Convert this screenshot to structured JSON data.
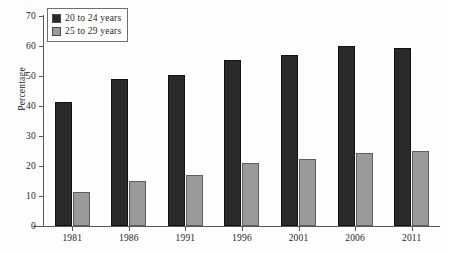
{
  "chart_data": {
    "type": "bar",
    "title": "",
    "xlabel": "",
    "ylabel": "Percentage",
    "categories": [
      "1981",
      "1986",
      "1991",
      "1996",
      "2001",
      "2006",
      "2011"
    ],
    "series": [
      {
        "name": "20 to 24 years",
        "color": "#2a2a2a",
        "values": [
          41.5,
          49,
          50.5,
          55.5,
          57,
          60,
          59.5
        ]
      },
      {
        "name": "25 to 29 years",
        "color": "#9a9a9a",
        "values": [
          11.5,
          15,
          17,
          21,
          22.5,
          24.5,
          25
        ]
      }
    ],
    "ylim": [
      0,
      70
    ],
    "ytick_values": [
      0,
      10,
      20,
      30,
      40,
      50,
      60,
      70
    ],
    "ytick_labels": [
      "0",
      "10",
      "20",
      "30",
      "40",
      "50",
      "60",
      "70"
    ],
    "grid": false,
    "legend_position": "upper left"
  },
  "legend": {
    "items": [
      {
        "label": "20 to 24 years",
        "swatch": "legend-swatch-dark"
      },
      {
        "label": "25 to 29 years",
        "swatch": "legend-swatch-gray"
      }
    ]
  }
}
